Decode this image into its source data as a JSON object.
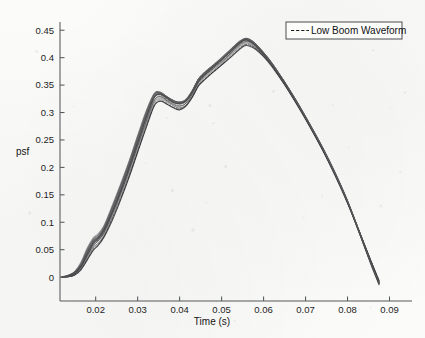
{
  "figure": {
    "background_color": "#fbfbfa",
    "ink_color": "#1a1a1a",
    "axis_color": "#55585a"
  },
  "axes": {
    "xlabel": "Time (s)",
    "ylabel": "psf",
    "x_ticks": [
      "0.02",
      "0.03",
      "0.04",
      "0.05",
      "0.06",
      "0.07",
      "0.08",
      "0.09"
    ],
    "y_ticks": [
      "0",
      "0.05",
      "0.1",
      "0.15",
      "0.2",
      "0.25",
      "0.3",
      "0.35",
      "0.4",
      "0.45"
    ]
  },
  "legend": {
    "entries": [
      {
        "label": "Low Boom Waveform",
        "style": "dashed",
        "color": "#1a1a1a"
      }
    ]
  },
  "chart_data": {
    "type": "line",
    "title": "",
    "xlabel": "Time (s)",
    "ylabel": "psf",
    "xlim": [
      0.0115,
      0.0925
    ],
    "ylim": [
      -0.018,
      0.465
    ],
    "x_ticks": [
      0.02,
      0.03,
      0.04,
      0.05,
      0.06,
      0.07,
      0.08,
      0.09
    ],
    "y_ticks": [
      0,
      0.05,
      0.1,
      0.15,
      0.2,
      0.25,
      0.3,
      0.35,
      0.4,
      0.45
    ],
    "grid": false,
    "legend_position": "top-right",
    "legend_entries": [
      "Low Boom Waveform"
    ],
    "series_count": 20,
    "features": {
      "onset_time": 0.013,
      "first_shoulder_time": 0.034,
      "first_shoulder_value": 0.335,
      "dip_time": 0.04,
      "dip_value": 0.315,
      "peak_time": 0.056,
      "peak_value": 0.435,
      "zero_crossing_range": [
        0.085,
        0.088
      ],
      "end_value": -0.012
    },
    "x": [
      0.012,
      0.0135,
      0.015,
      0.0165,
      0.018,
      0.0195,
      0.0205,
      0.022,
      0.024,
      0.026,
      0.028,
      0.03,
      0.032,
      0.034,
      0.0355,
      0.037,
      0.0385,
      0.04,
      0.0415,
      0.043,
      0.0445,
      0.046,
      0.048,
      0.05,
      0.052,
      0.054,
      0.0555,
      0.0565,
      0.058,
      0.06,
      0.062,
      0.065,
      0.068,
      0.071,
      0.074,
      0.077,
      0.08,
      0.083,
      0.0855,
      0.0875
    ],
    "series": [
      {
        "name": "Low Boom Waveform",
        "values": [
          0.0,
          0.002,
          0.008,
          0.022,
          0.046,
          0.066,
          0.072,
          0.088,
          0.124,
          0.163,
          0.205,
          0.25,
          0.295,
          0.331,
          0.334,
          0.327,
          0.32,
          0.317,
          0.322,
          0.338,
          0.36,
          0.372,
          0.385,
          0.398,
          0.412,
          0.426,
          0.434,
          0.433,
          0.425,
          0.408,
          0.389,
          0.355,
          0.318,
          0.278,
          0.236,
          0.19,
          0.138,
          0.078,
          0.028,
          -0.01
        ]
      },
      {
        "name": "Low Boom Waveform",
        "values": [
          0.0,
          0.002,
          0.007,
          0.02,
          0.043,
          0.063,
          0.07,
          0.086,
          0.12,
          0.159,
          0.201,
          0.246,
          0.291,
          0.329,
          0.333,
          0.326,
          0.319,
          0.316,
          0.321,
          0.337,
          0.358,
          0.37,
          0.383,
          0.396,
          0.41,
          0.424,
          0.432,
          0.431,
          0.424,
          0.407,
          0.388,
          0.354,
          0.317,
          0.277,
          0.235,
          0.189,
          0.137,
          0.077,
          0.027,
          -0.011
        ]
      },
      {
        "name": "Low Boom Waveform",
        "values": [
          0.0,
          0.003,
          0.009,
          0.024,
          0.049,
          0.069,
          0.075,
          0.091,
          0.128,
          0.167,
          0.209,
          0.254,
          0.299,
          0.334,
          0.336,
          0.329,
          0.322,
          0.319,
          0.324,
          0.34,
          0.362,
          0.374,
          0.387,
          0.4,
          0.414,
          0.428,
          0.435,
          0.434,
          0.426,
          0.409,
          0.39,
          0.356,
          0.319,
          0.279,
          0.237,
          0.191,
          0.139,
          0.079,
          0.029,
          -0.009
        ]
      },
      {
        "name": "Low Boom Waveform",
        "values": [
          0.0,
          0.001,
          0.006,
          0.017,
          0.038,
          0.058,
          0.065,
          0.081,
          0.115,
          0.153,
          0.194,
          0.238,
          0.283,
          0.322,
          0.328,
          0.322,
          0.315,
          0.311,
          0.316,
          0.332,
          0.354,
          0.366,
          0.379,
          0.392,
          0.406,
          0.42,
          0.428,
          0.428,
          0.421,
          0.405,
          0.386,
          0.352,
          0.316,
          0.276,
          0.234,
          0.188,
          0.136,
          0.077,
          0.027,
          -0.011
        ]
      },
      {
        "name": "Low Boom Waveform",
        "values": [
          0.0,
          0.001,
          0.005,
          0.015,
          0.034,
          0.053,
          0.06,
          0.076,
          0.109,
          0.146,
          0.187,
          0.231,
          0.276,
          0.316,
          0.323,
          0.318,
          0.312,
          0.308,
          0.313,
          0.329,
          0.35,
          0.362,
          0.375,
          0.388,
          0.402,
          0.416,
          0.424,
          0.424,
          0.418,
          0.403,
          0.385,
          0.351,
          0.315,
          0.275,
          0.233,
          0.187,
          0.136,
          0.078,
          0.029,
          -0.009
        ]
      },
      {
        "name": "Low Boom Waveform",
        "values": [
          0.0,
          0.002,
          0.008,
          0.021,
          0.045,
          0.065,
          0.071,
          0.087,
          0.122,
          0.161,
          0.203,
          0.248,
          0.293,
          0.33,
          0.333,
          0.326,
          0.32,
          0.317,
          0.322,
          0.338,
          0.359,
          0.371,
          0.384,
          0.397,
          0.411,
          0.425,
          0.433,
          0.432,
          0.424,
          0.407,
          0.388,
          0.354,
          0.317,
          0.277,
          0.235,
          0.189,
          0.137,
          0.077,
          0.027,
          -0.012
        ]
      },
      {
        "name": "Low Boom Waveform",
        "values": [
          0.0,
          0.003,
          0.01,
          0.026,
          0.052,
          0.072,
          0.078,
          0.094,
          0.131,
          0.17,
          0.212,
          0.257,
          0.301,
          0.335,
          0.336,
          0.328,
          0.321,
          0.318,
          0.323,
          0.339,
          0.361,
          0.373,
          0.386,
          0.399,
          0.413,
          0.427,
          0.434,
          0.433,
          0.425,
          0.408,
          0.389,
          0.355,
          0.318,
          0.278,
          0.236,
          0.19,
          0.138,
          0.078,
          0.028,
          -0.01
        ]
      },
      {
        "name": "Low Boom Waveform",
        "values": [
          0.0,
          0.001,
          0.005,
          0.016,
          0.036,
          0.055,
          0.062,
          0.078,
          0.112,
          0.15,
          0.191,
          0.235,
          0.28,
          0.319,
          0.326,
          0.32,
          0.313,
          0.309,
          0.314,
          0.33,
          0.351,
          0.364,
          0.377,
          0.39,
          0.404,
          0.418,
          0.426,
          0.426,
          0.419,
          0.404,
          0.386,
          0.352,
          0.316,
          0.276,
          0.234,
          0.188,
          0.137,
          0.079,
          0.03,
          -0.008
        ]
      },
      {
        "name": "Low Boom Waveform",
        "values": [
          0.0,
          0.002,
          0.007,
          0.019,
          0.041,
          0.061,
          0.068,
          0.084,
          0.118,
          0.156,
          0.198,
          0.243,
          0.288,
          0.327,
          0.332,
          0.325,
          0.318,
          0.315,
          0.32,
          0.336,
          0.357,
          0.369,
          0.382,
          0.395,
          0.409,
          0.423,
          0.431,
          0.43,
          0.423,
          0.406,
          0.387,
          0.353,
          0.317,
          0.277,
          0.235,
          0.189,
          0.138,
          0.079,
          0.029,
          -0.01
        ]
      },
      {
        "name": "Low Boom Waveform",
        "values": [
          0.0,
          0.002,
          0.009,
          0.023,
          0.047,
          0.067,
          0.073,
          0.089,
          0.126,
          0.165,
          0.207,
          0.252,
          0.297,
          0.332,
          0.335,
          0.328,
          0.321,
          0.318,
          0.323,
          0.339,
          0.36,
          0.372,
          0.385,
          0.398,
          0.412,
          0.426,
          0.434,
          0.433,
          0.425,
          0.408,
          0.389,
          0.355,
          0.318,
          0.278,
          0.236,
          0.19,
          0.138,
          0.078,
          0.028,
          -0.011
        ]
      },
      {
        "name": "Low Boom Waveform",
        "values": [
          0.0,
          0.001,
          0.004,
          0.013,
          0.031,
          0.05,
          0.057,
          0.073,
          0.105,
          0.142,
          0.183,
          0.227,
          0.272,
          0.312,
          0.32,
          0.315,
          0.309,
          0.305,
          0.311,
          0.327,
          0.348,
          0.36,
          0.373,
          0.386,
          0.4,
          0.414,
          0.422,
          0.422,
          0.416,
          0.402,
          0.384,
          0.35,
          0.314,
          0.274,
          0.232,
          0.186,
          0.135,
          0.078,
          0.03,
          -0.007
        ]
      },
      {
        "name": "Low Boom Waveform",
        "values": [
          0.0,
          0.002,
          0.008,
          0.022,
          0.044,
          0.064,
          0.07,
          0.086,
          0.121,
          0.16,
          0.202,
          0.247,
          0.292,
          0.33,
          0.334,
          0.327,
          0.32,
          0.317,
          0.322,
          0.338,
          0.359,
          0.371,
          0.384,
          0.397,
          0.411,
          0.425,
          0.433,
          0.432,
          0.424,
          0.407,
          0.388,
          0.354,
          0.317,
          0.277,
          0.235,
          0.189,
          0.137,
          0.077,
          0.026,
          -0.013
        ]
      },
      {
        "name": "Low Boom Waveform",
        "values": [
          0.0,
          0.003,
          0.01,
          0.025,
          0.05,
          0.07,
          0.076,
          0.092,
          0.129,
          0.168,
          0.21,
          0.255,
          0.3,
          0.334,
          0.336,
          0.329,
          0.322,
          0.319,
          0.324,
          0.34,
          0.362,
          0.374,
          0.387,
          0.4,
          0.414,
          0.428,
          0.435,
          0.434,
          0.426,
          0.409,
          0.39,
          0.356,
          0.319,
          0.279,
          0.237,
          0.191,
          0.139,
          0.079,
          0.029,
          -0.01
        ]
      },
      {
        "name": "Low Boom Waveform",
        "values": [
          0.0,
          0.001,
          0.006,
          0.018,
          0.039,
          0.059,
          0.066,
          0.082,
          0.116,
          0.154,
          0.195,
          0.239,
          0.284,
          0.323,
          0.329,
          0.323,
          0.316,
          0.312,
          0.317,
          0.333,
          0.355,
          0.367,
          0.38,
          0.393,
          0.407,
          0.421,
          0.429,
          0.429,
          0.422,
          0.406,
          0.387,
          0.353,
          0.317,
          0.277,
          0.235,
          0.189,
          0.138,
          0.08,
          0.031,
          -0.007
        ]
      },
      {
        "name": "Low Boom Waveform",
        "values": [
          0.0,
          0.002,
          0.007,
          0.02,
          0.042,
          0.062,
          0.069,
          0.085,
          0.119,
          0.157,
          0.199,
          0.244,
          0.289,
          0.328,
          0.332,
          0.325,
          0.319,
          0.316,
          0.321,
          0.337,
          0.358,
          0.37,
          0.383,
          0.396,
          0.41,
          0.424,
          0.432,
          0.431,
          0.423,
          0.406,
          0.387,
          0.353,
          0.316,
          0.276,
          0.234,
          0.188,
          0.136,
          0.076,
          0.026,
          -0.012
        ]
      },
      {
        "name": "Low Boom Waveform",
        "values": [
          0.0,
          0.002,
          0.009,
          0.024,
          0.048,
          0.068,
          0.074,
          0.09,
          0.127,
          0.166,
          0.208,
          0.253,
          0.298,
          0.333,
          0.335,
          0.328,
          0.321,
          0.318,
          0.323,
          0.339,
          0.361,
          0.373,
          0.386,
          0.399,
          0.413,
          0.427,
          0.434,
          0.433,
          0.425,
          0.408,
          0.389,
          0.355,
          0.318,
          0.278,
          0.236,
          0.19,
          0.138,
          0.078,
          0.027,
          -0.011
        ]
      },
      {
        "name": "Low Boom Waveform",
        "values": [
          0.0,
          0.001,
          0.004,
          0.014,
          0.032,
          0.051,
          0.058,
          0.074,
          0.107,
          0.144,
          0.185,
          0.229,
          0.274,
          0.314,
          0.321,
          0.316,
          0.31,
          0.306,
          0.312,
          0.328,
          0.349,
          0.361,
          0.374,
          0.387,
          0.401,
          0.415,
          0.423,
          0.423,
          0.417,
          0.403,
          0.385,
          0.351,
          0.315,
          0.275,
          0.233,
          0.187,
          0.136,
          0.079,
          0.031,
          -0.006
        ]
      },
      {
        "name": "Low Boom Waveform",
        "values": [
          0.0,
          0.002,
          0.008,
          0.021,
          0.043,
          0.063,
          0.07,
          0.086,
          0.12,
          0.158,
          0.2,
          0.245,
          0.29,
          0.329,
          0.333,
          0.326,
          0.319,
          0.316,
          0.321,
          0.337,
          0.358,
          0.37,
          0.383,
          0.396,
          0.41,
          0.424,
          0.432,
          0.431,
          0.423,
          0.406,
          0.387,
          0.353,
          0.316,
          0.276,
          0.234,
          0.188,
          0.136,
          0.076,
          0.025,
          -0.013
        ]
      },
      {
        "name": "Low Boom Waveform",
        "values": [
          0.0,
          0.003,
          0.011,
          0.027,
          0.053,
          0.073,
          0.079,
          0.095,
          0.132,
          0.171,
          0.213,
          0.258,
          0.302,
          0.335,
          0.336,
          0.329,
          0.322,
          0.319,
          0.324,
          0.34,
          0.362,
          0.374,
          0.387,
          0.4,
          0.414,
          0.428,
          0.435,
          0.434,
          0.426,
          0.409,
          0.39,
          0.356,
          0.319,
          0.279,
          0.237,
          0.191,
          0.139,
          0.079,
          0.028,
          -0.01
        ]
      },
      {
        "name": "Low Boom Waveform",
        "values": [
          0.0,
          0.001,
          0.005,
          0.015,
          0.035,
          0.054,
          0.061,
          0.077,
          0.11,
          0.148,
          0.189,
          0.233,
          0.278,
          0.318,
          0.325,
          0.319,
          0.313,
          0.309,
          0.314,
          0.33,
          0.352,
          0.364,
          0.377,
          0.39,
          0.404,
          0.418,
          0.426,
          0.426,
          0.419,
          0.404,
          0.386,
          0.352,
          0.316,
          0.276,
          0.234,
          0.188,
          0.137,
          0.08,
          0.032,
          -0.006
        ]
      }
    ]
  }
}
